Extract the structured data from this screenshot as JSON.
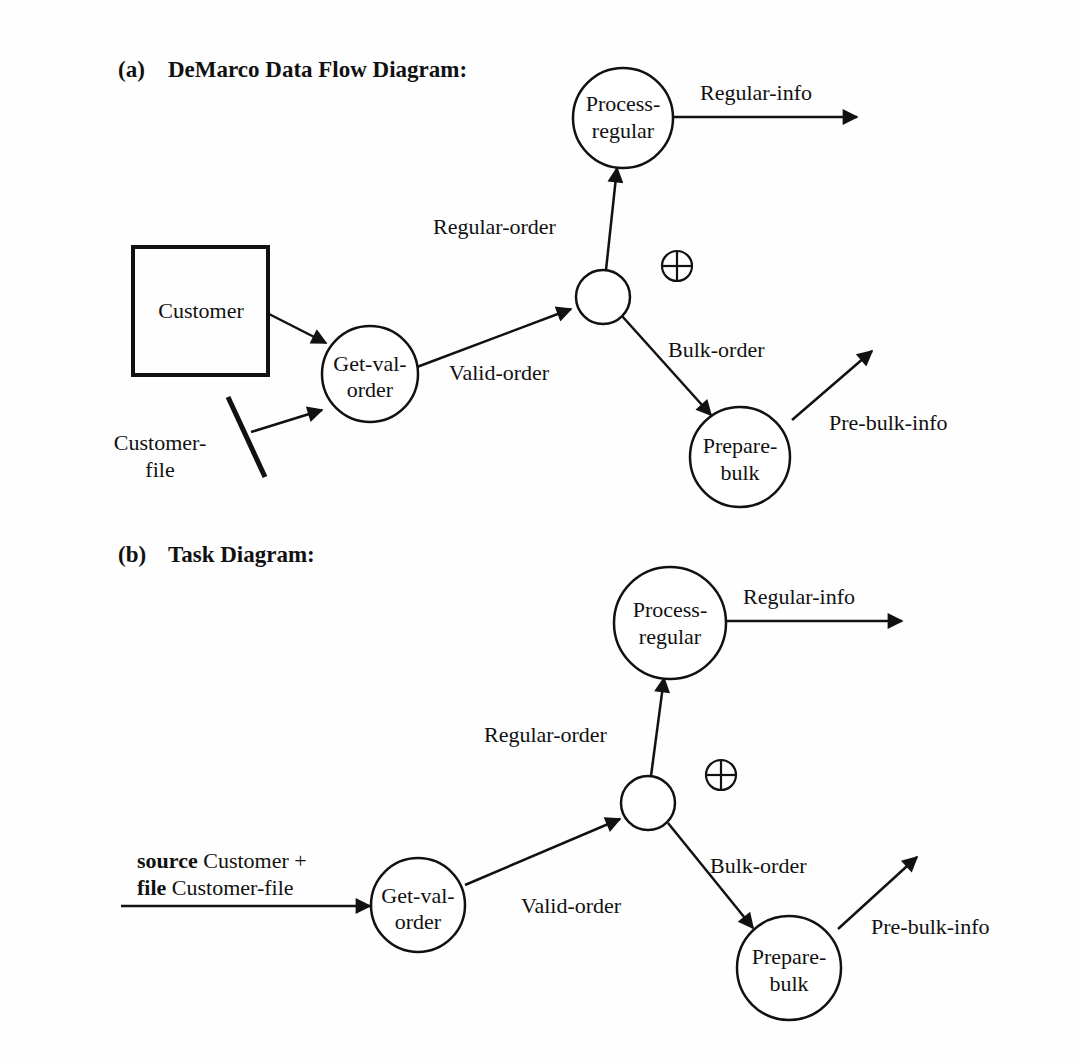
{
  "diagram_a": {
    "label": "(a)",
    "title": "DeMarco Data Flow Diagram:",
    "nodes": {
      "customer": "Customer",
      "customer_file": [
        "Customer-",
        "file"
      ],
      "get_val_order": [
        "Get-val-",
        "order"
      ],
      "process_regular": [
        "Process-",
        "regular"
      ],
      "prepare_bulk": [
        "Prepare-",
        "bulk"
      ],
      "xor_symbol": "⊕"
    },
    "flows": {
      "valid_order": "Valid-order",
      "regular_order": "Regular-order",
      "bulk_order": "Bulk-order",
      "regular_info": "Regular-info",
      "pre_bulk_info": "Pre-bulk-info"
    }
  },
  "diagram_b": {
    "label": "(b)",
    "title": "Task Diagram:",
    "input": {
      "line1_keyword": "source",
      "line1_text": " Customer +",
      "line2_keyword": "file",
      "line2_text": " Customer-file"
    },
    "nodes": {
      "get_val_order": [
        "Get-val-",
        "order"
      ],
      "process_regular": [
        "Process-",
        "regular"
      ],
      "prepare_bulk": [
        "Prepare-",
        "bulk"
      ],
      "xor_symbol": "⊕"
    },
    "flows": {
      "valid_order": "Valid-order",
      "regular_order": "Regular-order",
      "bulk_order": "Bulk-order",
      "regular_info": "Regular-info",
      "pre_bulk_info": "Pre-bulk-info"
    }
  }
}
